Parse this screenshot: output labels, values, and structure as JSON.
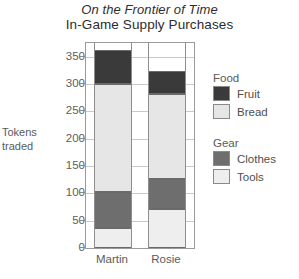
{
  "chart_data": {
    "type": "bar",
    "subtype": "stacked-bar",
    "title": "On the Frontier of Time",
    "subtitle": "In-Game Supply Purchases",
    "xlabel": "",
    "ylabel": "Tokens traded",
    "ylabel_line1": "Tokens",
    "ylabel_line2": "traded",
    "categories": [
      "Martin",
      "Rosie"
    ],
    "ylim": [
      0,
      375
    ],
    "yticks": [
      0,
      50,
      100,
      150,
      200,
      250,
      300,
      350
    ],
    "ytick_labels": [
      "0",
      "50",
      "100",
      "150",
      "200",
      "250",
      "300",
      "350"
    ],
    "grid": true,
    "legend_position": "right",
    "stack_order_bottom_to_top": [
      "Tools",
      "Clothes",
      "Bread",
      "Fruit"
    ],
    "series": [
      {
        "name": "Tools",
        "values": [
          37,
          72
        ],
        "color": "#eeeeee"
      },
      {
        "name": "Clothes",
        "values": [
          66,
          55
        ],
        "color": "#6e6e6e"
      },
      {
        "name": "Bread",
        "values": [
          197,
          155
        ],
        "color": "#e6e6e6"
      },
      {
        "name": "Fruit",
        "values": [
          62,
          42
        ],
        "color": "#3a3a3a"
      }
    ],
    "cumulative_tops": {
      "Martin": {
        "Tools": 37,
        "Clothes": 103,
        "Bread": 300,
        "Fruit": 362
      },
      "Rosie": {
        "Tools": 72,
        "Clothes": 127,
        "Bread": 282,
        "Fruit": 324
      }
    },
    "totals": [
      362,
      324
    ]
  },
  "legend": {
    "groups": [
      {
        "title": "Food",
        "entries": [
          {
            "label": "Fruit",
            "color": "#3a3a3a"
          },
          {
            "label": "Bread",
            "color": "#e6e6e6"
          }
        ]
      },
      {
        "title": "Gear",
        "entries": [
          {
            "label": "Clothes",
            "color": "#6e6e6e"
          },
          {
            "label": "Tools",
            "color": "#eeeeee"
          }
        ]
      }
    ]
  }
}
